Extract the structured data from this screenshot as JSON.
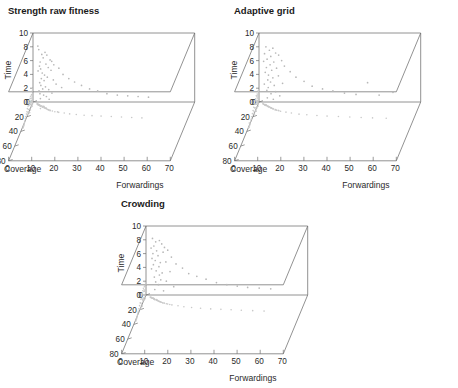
{
  "figure": {
    "panel_count": 3,
    "point_color": "#b8b8b8",
    "axis_color": "#6e6e6e"
  },
  "panels": [
    {
      "title": "Strength raw fitness"
    },
    {
      "title": "Adaptive grid"
    },
    {
      "title": "Crowding"
    }
  ],
  "axes": {
    "time_label": "Time",
    "coverage_label": "Coverage",
    "forwardings_label": "Forwardings",
    "time_ticks": [
      "0",
      "2",
      "4",
      "6",
      "8",
      "10"
    ],
    "coverage_ticks": [
      "0",
      "20",
      "40",
      "60",
      "80"
    ],
    "forwardings_ticks": [
      "0",
      "10",
      "20",
      "30",
      "40",
      "50",
      "60",
      "70"
    ]
  },
  "chart_data": [
    {
      "type": "scatter",
      "title": "Strength raw fitness",
      "xlabel": "Forwardings",
      "ylabel": "Coverage",
      "zlabel": "Time",
      "xlim": [
        0,
        70
      ],
      "ylim": [
        0,
        80
      ],
      "zlim": [
        0,
        10
      ],
      "grid": false,
      "legend": "none",
      "points": [
        [
          2.5,
          12,
          7.6
        ],
        [
          3.8,
          18,
          6.9
        ],
        [
          2.1,
          9,
          8.1
        ],
        [
          5.2,
          24,
          7.2
        ],
        [
          4.4,
          30,
          6.4
        ],
        [
          3.1,
          15,
          5.8
        ],
        [
          6.0,
          27,
          6.8
        ],
        [
          2.8,
          11,
          5.2
        ],
        [
          7.4,
          33,
          6.1
        ],
        [
          5.6,
          21,
          5.5
        ],
        [
          3.3,
          14,
          4.8
        ],
        [
          8.1,
          36,
          5.9
        ],
        [
          4.0,
          19,
          4.2
        ],
        [
          6.6,
          29,
          5.0
        ],
        [
          2.2,
          8,
          4.5
        ],
        [
          9.0,
          40,
          5.4
        ],
        [
          5.0,
          23,
          3.9
        ],
        [
          3.6,
          16,
          3.4
        ],
        [
          7.8,
          34,
          4.6
        ],
        [
          4.8,
          22,
          3.1
        ],
        [
          11.2,
          44,
          4.9
        ],
        [
          2.9,
          12,
          2.8
        ],
        [
          6.2,
          26,
          3.6
        ],
        [
          13.0,
          47,
          4.0
        ],
        [
          3.4,
          13,
          2.4
        ],
        [
          8.8,
          37,
          3.2
        ],
        [
          5.4,
          20,
          2.2
        ],
        [
          15.5,
          50,
          3.4
        ],
        [
          4.2,
          17,
          1.9
        ],
        [
          10.0,
          41,
          2.6
        ],
        [
          2.6,
          10,
          1.6
        ],
        [
          18.0,
          54,
          2.9
        ],
        [
          6.8,
          28,
          1.8
        ],
        [
          3.0,
          11,
          1.2
        ],
        [
          12.4,
          45,
          2.1
        ],
        [
          21.0,
          57,
          2.4
        ],
        [
          4.6,
          18,
          1.0
        ],
        [
          24.5,
          60,
          1.9
        ],
        [
          8.2,
          35,
          1.3
        ],
        [
          28.0,
          62,
          1.6
        ],
        [
          5.8,
          25,
          0.8
        ],
        [
          32.0,
          64,
          1.2
        ],
        [
          36.5,
          66,
          1.0
        ],
        [
          41.0,
          68,
          0.9
        ],
        [
          45.5,
          70,
          0.8
        ],
        [
          50.0,
          72,
          0.7
        ],
        [
          3.2,
          13,
          0.5
        ],
        [
          7.0,
          30,
          0.4
        ]
      ]
    },
    {
      "type": "scatter",
      "title": "Adaptive grid",
      "xlabel": "Forwardings",
      "ylabel": "Coverage",
      "zlabel": "Time",
      "xlim": [
        0,
        70
      ],
      "ylim": [
        0,
        80
      ],
      "zlim": [
        0,
        10
      ],
      "grid": false,
      "legend": "none",
      "points": [
        [
          3.0,
          14,
          8.0
        ],
        [
          4.5,
          20,
          7.5
        ],
        [
          2.4,
          10,
          7.0
        ],
        [
          6.0,
          26,
          7.8
        ],
        [
          5.1,
          22,
          6.6
        ],
        [
          3.5,
          16,
          6.2
        ],
        [
          7.2,
          30,
          7.1
        ],
        [
          2.0,
          8,
          5.9
        ],
        [
          8.5,
          34,
          6.8
        ],
        [
          4.8,
          19,
          5.4
        ],
        [
          6.4,
          27,
          5.8
        ],
        [
          3.2,
          13,
          5.0
        ],
        [
          9.8,
          38,
          6.0
        ],
        [
          5.5,
          23,
          4.6
        ],
        [
          2.7,
          11,
          4.3
        ],
        [
          7.6,
          32,
          4.9
        ],
        [
          4.1,
          17,
          3.9
        ],
        [
          11.0,
          42,
          5.2
        ],
        [
          6.0,
          25,
          3.5
        ],
        [
          3.8,
          15,
          3.2
        ],
        [
          13.5,
          46,
          4.4
        ],
        [
          5.0,
          21,
          2.9
        ],
        [
          8.4,
          36,
          3.8
        ],
        [
          2.3,
          9,
          2.6
        ],
        [
          16.0,
          50,
          3.6
        ],
        [
          6.6,
          28,
          2.4
        ],
        [
          4.0,
          16,
          2.1
        ],
        [
          19.5,
          55,
          3.0
        ],
        [
          10.2,
          40,
          2.7
        ],
        [
          3.4,
          12,
          1.7
        ],
        [
          23.0,
          58,
          2.3
        ],
        [
          7.2,
          31,
          1.5
        ],
        [
          27.5,
          61,
          1.9
        ],
        [
          5.2,
          22,
          1.2
        ],
        [
          32.0,
          64,
          1.6
        ],
        [
          37.0,
          66,
          1.3
        ],
        [
          42.0,
          68,
          1.1
        ],
        [
          47.0,
          70,
          2.8
        ],
        [
          52.0,
          72,
          1.0
        ],
        [
          3.6,
          14,
          0.6
        ],
        [
          9.0,
          37,
          0.9
        ],
        [
          58.0,
          74,
          1.4
        ],
        [
          6.2,
          26,
          0.4
        ]
      ]
    },
    {
      "type": "scatter",
      "title": "Crowding",
      "xlabel": "Forwardings",
      "ylabel": "Coverage",
      "zlabel": "Time",
      "xlim": [
        0,
        70
      ],
      "ylim": [
        0,
        80
      ],
      "zlim": [
        0,
        10
      ],
      "grid": false,
      "legend": "none",
      "points": [
        [
          2.8,
          12,
          8.2
        ],
        [
          4.2,
          19,
          7.7
        ],
        [
          3.4,
          15,
          7.1
        ],
        [
          5.8,
          25,
          7.9
        ],
        [
          2.2,
          9,
          6.8
        ],
        [
          6.8,
          29,
          7.4
        ],
        [
          4.6,
          21,
          6.4
        ],
        [
          3.0,
          13,
          6.0
        ],
        [
          8.0,
          33,
          6.9
        ],
        [
          5.2,
          22,
          5.7
        ],
        [
          7.4,
          31,
          6.2
        ],
        [
          2.6,
          10,
          5.3
        ],
        [
          9.4,
          37,
          6.5
        ],
        [
          4.0,
          17,
          5.0
        ],
        [
          6.2,
          26,
          4.7
        ],
        [
          3.2,
          14,
          4.4
        ],
        [
          11.0,
          41,
          5.5
        ],
        [
          5.6,
          23,
          4.1
        ],
        [
          8.6,
          35,
          4.8
        ],
        [
          2.4,
          11,
          3.8
        ],
        [
          13.0,
          45,
          4.5
        ],
        [
          4.4,
          18,
          3.5
        ],
        [
          7.0,
          30,
          3.2
        ],
        [
          15.8,
          49,
          3.9
        ],
        [
          5.8,
          24,
          2.9
        ],
        [
          3.6,
          15,
          2.6
        ],
        [
          10.4,
          40,
          3.4
        ],
        [
          18.5,
          53,
          3.1
        ],
        [
          6.4,
          27,
          2.2
        ],
        [
          4.2,
          17,
          1.9
        ],
        [
          22.0,
          57,
          2.7
        ],
        [
          8.8,
          36,
          2.0
        ],
        [
          26.0,
          60,
          2.3
        ],
        [
          5.4,
          21,
          1.5
        ],
        [
          30.5,
          63,
          1.8
        ],
        [
          35.0,
          65,
          1.5
        ],
        [
          39.5,
          67,
          1.3
        ],
        [
          44.0,
          69,
          1.1
        ],
        [
          49.0,
          71,
          1.0
        ],
        [
          3.8,
          14,
          0.8
        ],
        [
          7.6,
          32,
          0.6
        ],
        [
          54.0,
          73,
          0.9
        ],
        [
          12.0,
          43,
          1.2
        ]
      ]
    }
  ]
}
